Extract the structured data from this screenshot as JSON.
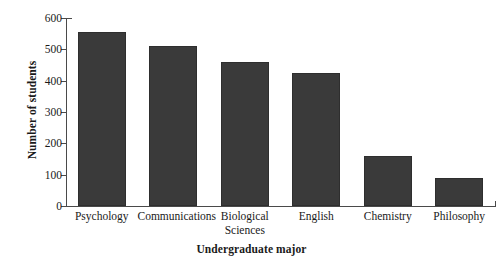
{
  "chart_data": {
    "type": "bar",
    "title": "",
    "xlabel": "Undergraduate major",
    "ylabel": "Number of students",
    "categories": [
      "Psychology",
      "Communications",
      "Biological\nSciences",
      "English",
      "Chemistry",
      "Philosophy"
    ],
    "values": [
      555,
      512,
      458,
      425,
      160,
      90
    ],
    "ylim": [
      0,
      600
    ],
    "ytick_labels": [
      "0",
      "100",
      "200",
      "300",
      "400",
      "500",
      "600"
    ],
    "ytick_values": [
      0,
      100,
      200,
      300,
      400,
      500,
      600
    ],
    "grid": false,
    "legend": false,
    "bar_color": "#3a3a3a",
    "axis_color": "#4a4a4a",
    "background": "#ffffff"
  }
}
